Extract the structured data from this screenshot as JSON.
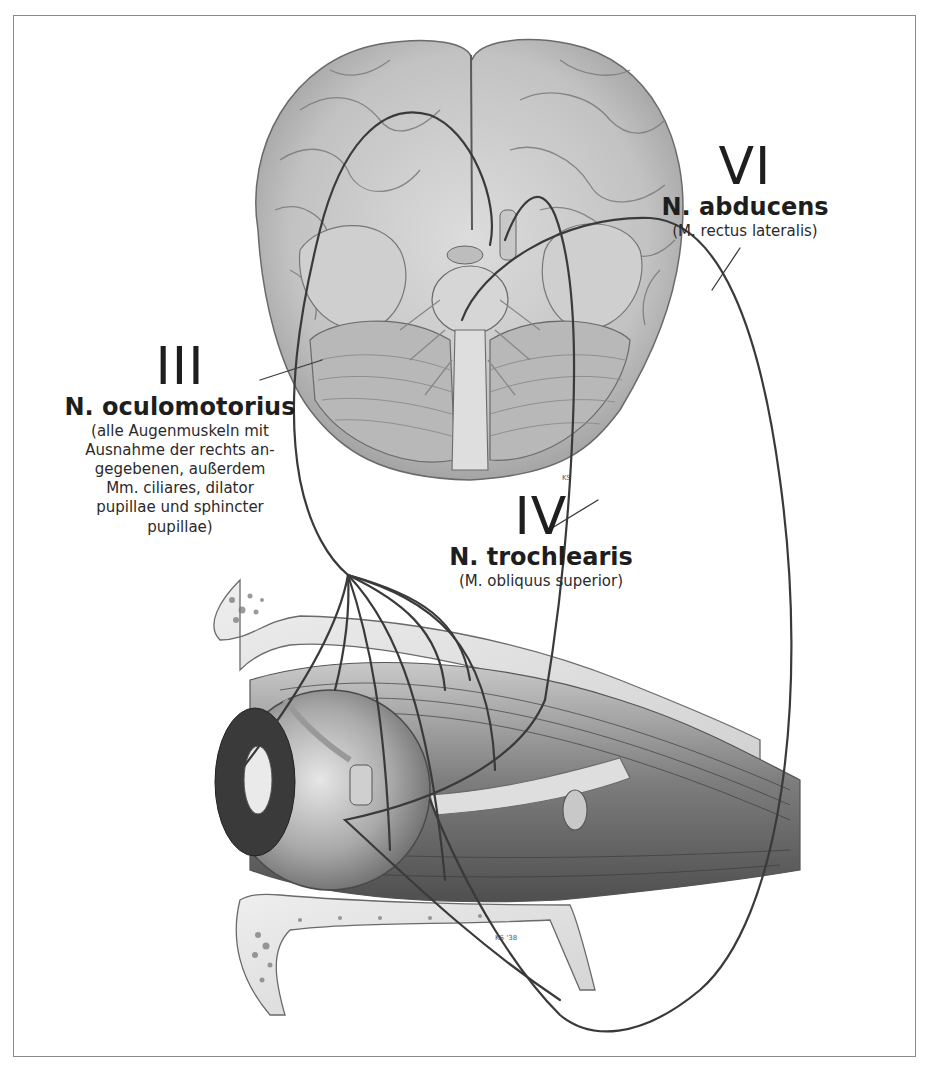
{
  "figure": {
    "colors": {
      "frame": "#8a8a8a",
      "nerve_line": "#3a3a3a",
      "illustration_light": "#e4e4e4",
      "illustration_mid": "#a8a8a8",
      "illustration_dark": "#5a5a5a",
      "text": "#1e1e1e"
    }
  },
  "labels": {
    "abducens": {
      "numeral": "VI",
      "name": "N. abducens",
      "muscles": "(M. rectus lateralis)"
    },
    "oculomotorius": {
      "numeral": "III",
      "name": "N. oculomotorius",
      "muscles": "(alle Augenmuskeln mit\nAusnahme der rechts an-\ngegebenen, außerdem\nMm. ciliares, dilator\npupillae und sphincter\npupillae)"
    },
    "trochlearis": {
      "numeral": "IV",
      "name": "N. trochlearis",
      "muscles": "(M. obliquus superior)"
    }
  },
  "illustrations": {
    "brain": "brain-basal-view",
    "orbit": "eye-orbit-lateral-view"
  },
  "signatures": [
    "KS",
    "KS '38"
  ]
}
